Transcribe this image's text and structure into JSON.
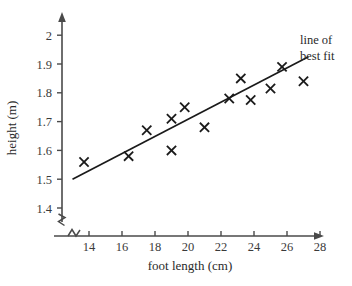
{
  "chart_data": {
    "type": "scatter",
    "title": "",
    "xlabel": "foot length (cm)",
    "ylabel": "height (m)",
    "xlim": [
      12.2,
      29.0
    ],
    "ylim": [
      1.35,
      2.03
    ],
    "xticks": [
      "14",
      "16",
      "18",
      "20",
      "22",
      "24",
      "26",
      "28"
    ],
    "xtick_values": [
      14,
      16,
      18,
      20,
      22,
      24,
      26,
      28
    ],
    "yticks": [
      "1.4",
      "1.5",
      "1.6",
      "1.7",
      "1.8",
      "1.9",
      "2"
    ],
    "ytick_values": [
      1.4,
      1.5,
      1.6,
      1.7,
      1.8,
      1.9,
      2.0
    ],
    "grid": false,
    "legend": false,
    "axis_break_x": true,
    "axis_break_y": true,
    "marker_style": "x",
    "points": [
      {
        "x": 13.7,
        "y": 1.56
      },
      {
        "x": 16.4,
        "y": 1.58
      },
      {
        "x": 17.5,
        "y": 1.67
      },
      {
        "x": 19.0,
        "y": 1.6
      },
      {
        "x": 19.0,
        "y": 1.71
      },
      {
        "x": 19.8,
        "y": 1.75
      },
      {
        "x": 21.0,
        "y": 1.68
      },
      {
        "x": 22.5,
        "y": 1.78
      },
      {
        "x": 23.2,
        "y": 1.85
      },
      {
        "x": 23.8,
        "y": 1.775
      },
      {
        "x": 25.0,
        "y": 1.815
      },
      {
        "x": 25.7,
        "y": 1.89
      },
      {
        "x": 27.0,
        "y": 1.84
      }
    ],
    "fit_line": {
      "label_line1": "line of",
      "label_line2": "best fit",
      "x_start": 13.0,
      "y_start": 1.5,
      "x_end": 27.3,
      "y_end": 1.925
    }
  },
  "colors": {
    "axis": "#4a4a4a",
    "marker": "#1a1a1a",
    "fit_line": "#1a1a1a",
    "text": "#2a2a2a",
    "background": "#ffffff"
  }
}
